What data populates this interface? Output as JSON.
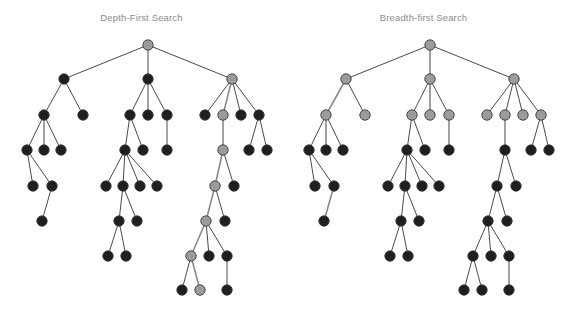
{
  "figure": {
    "type": "diagram",
    "width": 565,
    "height": 310,
    "background": "#ffffff"
  },
  "style": {
    "node_radius": 5.2,
    "node_dark_fill": "#1f1f1f",
    "node_gray_fill": "#9b9b9b",
    "node_stroke": "#3a3a3a",
    "node_stroke_width": 0.9,
    "edge_color": "#4a4a4a",
    "edge_width": 1.0,
    "edge_highlight_color": "#8a8a8a",
    "edge_highlight_width": 1.6,
    "title_color": "#8c8c8c",
    "title_size_px": 9.5
  },
  "panels": [
    {
      "id": "dfs",
      "title": "Depth-First Search",
      "legend_note": "gray nodes mark the depth-first visited path",
      "nodes": [
        {
          "id": "r",
          "x": 148,
          "y": 45,
          "c": "gray"
        },
        {
          "id": "a",
          "x": 64,
          "y": 79,
          "c": "dark"
        },
        {
          "id": "b",
          "x": 148,
          "y": 79,
          "c": "dark"
        },
        {
          "id": "c",
          "x": 232,
          "y": 79,
          "c": "gray"
        },
        {
          "id": "a1",
          "x": 44,
          "y": 115,
          "c": "dark"
        },
        {
          "id": "a2",
          "x": 83,
          "y": 115,
          "c": "dark"
        },
        {
          "id": "a1a",
          "x": 27,
          "y": 150,
          "c": "dark"
        },
        {
          "id": "a1b",
          "x": 44,
          "y": 150,
          "c": "dark"
        },
        {
          "id": "a1c",
          "x": 61,
          "y": 150,
          "c": "dark"
        },
        {
          "id": "a1a1",
          "x": 33,
          "y": 186,
          "c": "dark"
        },
        {
          "id": "a1a2",
          "x": 52,
          "y": 186,
          "c": "dark"
        },
        {
          "id": "a1a2a",
          "x": 42,
          "y": 221,
          "c": "dark"
        },
        {
          "id": "b1",
          "x": 130,
          "y": 115,
          "c": "dark"
        },
        {
          "id": "b2",
          "x": 148,
          "y": 115,
          "c": "dark"
        },
        {
          "id": "b3",
          "x": 167,
          "y": 115,
          "c": "dark"
        },
        {
          "id": "b1a",
          "x": 125,
          "y": 150,
          "c": "dark"
        },
        {
          "id": "b1b",
          "x": 143,
          "y": 150,
          "c": "dark"
        },
        {
          "id": "b3a",
          "x": 167,
          "y": 150,
          "c": "dark"
        },
        {
          "id": "b1a1",
          "x": 106,
          "y": 186,
          "c": "dark"
        },
        {
          "id": "b1a2",
          "x": 123,
          "y": 186,
          "c": "dark"
        },
        {
          "id": "b1a3",
          "x": 140,
          "y": 186,
          "c": "dark"
        },
        {
          "id": "b1a4",
          "x": 157,
          "y": 186,
          "c": "dark"
        },
        {
          "id": "b1a2a",
          "x": 119,
          "y": 221,
          "c": "dark"
        },
        {
          "id": "b1a2b",
          "x": 137,
          "y": 221,
          "c": "dark"
        },
        {
          "id": "b1a2a1",
          "x": 108,
          "y": 256,
          "c": "dark"
        },
        {
          "id": "b1a2a2",
          "x": 126,
          "y": 256,
          "c": "dark"
        },
        {
          "id": "c1",
          "x": 205,
          "y": 115,
          "c": "dark"
        },
        {
          "id": "c2",
          "x": 223,
          "y": 115,
          "c": "gray"
        },
        {
          "id": "c3",
          "x": 241,
          "y": 115,
          "c": "dark"
        },
        {
          "id": "c4",
          "x": 259,
          "y": 115,
          "c": "dark"
        },
        {
          "id": "c2a",
          "x": 223,
          "y": 150,
          "c": "gray"
        },
        {
          "id": "c4a",
          "x": 249,
          "y": 150,
          "c": "dark"
        },
        {
          "id": "c4b",
          "x": 267,
          "y": 150,
          "c": "dark"
        },
        {
          "id": "c2a1",
          "x": 215,
          "y": 186,
          "c": "gray"
        },
        {
          "id": "c2a2",
          "x": 234,
          "y": 186,
          "c": "dark"
        },
        {
          "id": "c2a1a",
          "x": 206,
          "y": 221,
          "c": "gray"
        },
        {
          "id": "c2a1b",
          "x": 225,
          "y": 221,
          "c": "dark"
        },
        {
          "id": "d1",
          "x": 191,
          "y": 256,
          "c": "gray"
        },
        {
          "id": "d2",
          "x": 209,
          "y": 256,
          "c": "dark"
        },
        {
          "id": "d3",
          "x": 227,
          "y": 256,
          "c": "dark"
        },
        {
          "id": "e1",
          "x": 182,
          "y": 290,
          "c": "dark"
        },
        {
          "id": "e2",
          "x": 200,
          "y": 290,
          "c": "gray"
        },
        {
          "id": "e3",
          "x": 227,
          "y": 290,
          "c": "dark"
        }
      ],
      "edges": [
        {
          "f": "r",
          "t": "a",
          "h": false
        },
        {
          "f": "r",
          "t": "b",
          "h": false
        },
        {
          "f": "r",
          "t": "c",
          "h": false
        },
        {
          "f": "a",
          "t": "a1",
          "h": false
        },
        {
          "f": "a",
          "t": "a2",
          "h": false
        },
        {
          "f": "a1",
          "t": "a1a",
          "h": false
        },
        {
          "f": "a1",
          "t": "a1b",
          "h": false
        },
        {
          "f": "a1",
          "t": "a1c",
          "h": false
        },
        {
          "f": "a1a",
          "t": "a1a1",
          "h": false
        },
        {
          "f": "a1a",
          "t": "a1a2",
          "h": false
        },
        {
          "f": "a1a2",
          "t": "a1a2a",
          "h": false
        },
        {
          "f": "b",
          "t": "b1",
          "h": false
        },
        {
          "f": "b",
          "t": "b2",
          "h": false
        },
        {
          "f": "b",
          "t": "b3",
          "h": false
        },
        {
          "f": "b1",
          "t": "b1a",
          "h": false
        },
        {
          "f": "b1",
          "t": "b1b",
          "h": false
        },
        {
          "f": "b3",
          "t": "b3a",
          "h": false
        },
        {
          "f": "b1a",
          "t": "b1a1",
          "h": false
        },
        {
          "f": "b1a",
          "t": "b1a2",
          "h": false
        },
        {
          "f": "b1a",
          "t": "b1a3",
          "h": false
        },
        {
          "f": "b1a",
          "t": "b1a4",
          "h": false
        },
        {
          "f": "b1a2",
          "t": "b1a2a",
          "h": false
        },
        {
          "f": "b1a2",
          "t": "b1a2b",
          "h": false
        },
        {
          "f": "b1a2a",
          "t": "b1a2a1",
          "h": false
        },
        {
          "f": "b1a2a",
          "t": "b1a2a2",
          "h": false
        },
        {
          "f": "c",
          "t": "c1",
          "h": false
        },
        {
          "f": "c",
          "t": "c2",
          "h": true
        },
        {
          "f": "c",
          "t": "c3",
          "h": false
        },
        {
          "f": "c",
          "t": "c4",
          "h": false
        },
        {
          "f": "c2",
          "t": "c2a",
          "h": true
        },
        {
          "f": "c4",
          "t": "c4a",
          "h": false
        },
        {
          "f": "c4",
          "t": "c4b",
          "h": false
        },
        {
          "f": "c2a",
          "t": "c2a1",
          "h": true
        },
        {
          "f": "c2a",
          "t": "c2a2",
          "h": false
        },
        {
          "f": "c2a1",
          "t": "c2a1a",
          "h": true
        },
        {
          "f": "c2a1",
          "t": "c2a1b",
          "h": false
        },
        {
          "f": "c2a1a",
          "t": "d1",
          "h": true
        },
        {
          "f": "c2a1a",
          "t": "d2",
          "h": false
        },
        {
          "f": "c2a1a",
          "t": "d3",
          "h": false
        },
        {
          "f": "d1",
          "t": "e1",
          "h": false
        },
        {
          "f": "d1",
          "t": "e2",
          "h": true
        },
        {
          "f": "d3",
          "t": "e3",
          "h": false
        }
      ]
    },
    {
      "id": "bfs",
      "title": "Breadth-first Search",
      "legend_note": "gray nodes mark the breadth-first visited frontier",
      "nodes": [
        {
          "id": "r",
          "x": 148,
          "y": 45,
          "c": "gray"
        },
        {
          "id": "a",
          "x": 64,
          "y": 79,
          "c": "gray"
        },
        {
          "id": "b",
          "x": 148,
          "y": 79,
          "c": "gray"
        },
        {
          "id": "c",
          "x": 232,
          "y": 79,
          "c": "gray"
        },
        {
          "id": "a1",
          "x": 44,
          "y": 115,
          "c": "gray"
        },
        {
          "id": "a2",
          "x": 83,
          "y": 115,
          "c": "gray"
        },
        {
          "id": "a1a",
          "x": 27,
          "y": 150,
          "c": "dark"
        },
        {
          "id": "a1b",
          "x": 44,
          "y": 150,
          "c": "dark"
        },
        {
          "id": "a1c",
          "x": 61,
          "y": 150,
          "c": "dark"
        },
        {
          "id": "a1a1",
          "x": 33,
          "y": 186,
          "c": "dark"
        },
        {
          "id": "a1a2",
          "x": 52,
          "y": 186,
          "c": "dark"
        },
        {
          "id": "a1a2a",
          "x": 42,
          "y": 221,
          "c": "dark"
        },
        {
          "id": "b1",
          "x": 130,
          "y": 115,
          "c": "gray"
        },
        {
          "id": "b2",
          "x": 148,
          "y": 115,
          "c": "gray"
        },
        {
          "id": "b3",
          "x": 167,
          "y": 115,
          "c": "gray"
        },
        {
          "id": "b1a",
          "x": 125,
          "y": 150,
          "c": "dark"
        },
        {
          "id": "b1b",
          "x": 143,
          "y": 150,
          "c": "dark"
        },
        {
          "id": "b3a",
          "x": 167,
          "y": 150,
          "c": "dark"
        },
        {
          "id": "b1a1",
          "x": 106,
          "y": 186,
          "c": "dark"
        },
        {
          "id": "b1a2",
          "x": 123,
          "y": 186,
          "c": "dark"
        },
        {
          "id": "b1a3",
          "x": 140,
          "y": 186,
          "c": "dark"
        },
        {
          "id": "b1a4",
          "x": 157,
          "y": 186,
          "c": "dark"
        },
        {
          "id": "b1a2a",
          "x": 119,
          "y": 221,
          "c": "dark"
        },
        {
          "id": "b1a2b",
          "x": 137,
          "y": 221,
          "c": "dark"
        },
        {
          "id": "b1a2a1",
          "x": 108,
          "y": 256,
          "c": "dark"
        },
        {
          "id": "b1a2a2",
          "x": 126,
          "y": 256,
          "c": "dark"
        },
        {
          "id": "c1",
          "x": 205,
          "y": 115,
          "c": "gray"
        },
        {
          "id": "c2",
          "x": 223,
          "y": 115,
          "c": "gray"
        },
        {
          "id": "c3",
          "x": 241,
          "y": 115,
          "c": "gray"
        },
        {
          "id": "c4",
          "x": 259,
          "y": 115,
          "c": "gray"
        },
        {
          "id": "c2a",
          "x": 223,
          "y": 150,
          "c": "dark"
        },
        {
          "id": "c4a",
          "x": 249,
          "y": 150,
          "c": "dark"
        },
        {
          "id": "c4b",
          "x": 267,
          "y": 150,
          "c": "dark"
        },
        {
          "id": "c2a1",
          "x": 215,
          "y": 186,
          "c": "dark"
        },
        {
          "id": "c2a2",
          "x": 234,
          "y": 186,
          "c": "dark"
        },
        {
          "id": "c2a1a",
          "x": 206,
          "y": 221,
          "c": "dark"
        },
        {
          "id": "c2a1b",
          "x": 225,
          "y": 221,
          "c": "dark"
        },
        {
          "id": "d1",
          "x": 191,
          "y": 256,
          "c": "dark"
        },
        {
          "id": "d2",
          "x": 209,
          "y": 256,
          "c": "dark"
        },
        {
          "id": "d3",
          "x": 227,
          "y": 256,
          "c": "dark"
        },
        {
          "id": "e1",
          "x": 182,
          "y": 290,
          "c": "dark"
        },
        {
          "id": "e2",
          "x": 200,
          "y": 290,
          "c": "dark"
        },
        {
          "id": "e3",
          "x": 227,
          "y": 290,
          "c": "dark"
        }
      ],
      "edges": [
        {
          "f": "r",
          "t": "a",
          "h": false
        },
        {
          "f": "r",
          "t": "b",
          "h": true
        },
        {
          "f": "r",
          "t": "c",
          "h": false
        },
        {
          "f": "a",
          "t": "a1",
          "h": true
        },
        {
          "f": "a",
          "t": "a2",
          "h": false
        },
        {
          "f": "a1",
          "t": "a1a",
          "h": false
        },
        {
          "f": "a1",
          "t": "a1b",
          "h": true
        },
        {
          "f": "a1",
          "t": "a1c",
          "h": false
        },
        {
          "f": "a1a",
          "t": "a1a1",
          "h": false
        },
        {
          "f": "a1a",
          "t": "a1a2",
          "h": false
        },
        {
          "f": "a1a2",
          "t": "a1a2a",
          "h": true
        },
        {
          "f": "b",
          "t": "b1",
          "h": false
        },
        {
          "f": "b",
          "t": "b2",
          "h": true
        },
        {
          "f": "b",
          "t": "b3",
          "h": false
        },
        {
          "f": "b1",
          "t": "b1a",
          "h": false
        },
        {
          "f": "b1",
          "t": "b1b",
          "h": false
        },
        {
          "f": "b3",
          "t": "b3a",
          "h": true
        },
        {
          "f": "b1a",
          "t": "b1a1",
          "h": false
        },
        {
          "f": "b1a",
          "t": "b1a2",
          "h": false
        },
        {
          "f": "b1a",
          "t": "b1a3",
          "h": false
        },
        {
          "f": "b1a",
          "t": "b1a4",
          "h": false
        },
        {
          "f": "b1a2",
          "t": "b1a2a",
          "h": false
        },
        {
          "f": "b1a2",
          "t": "b1a2b",
          "h": false
        },
        {
          "f": "b1a2a",
          "t": "b1a2a1",
          "h": false
        },
        {
          "f": "b1a2a",
          "t": "b1a2a2",
          "h": false
        },
        {
          "f": "c",
          "t": "c1",
          "h": false
        },
        {
          "f": "c",
          "t": "c2",
          "h": false
        },
        {
          "f": "c",
          "t": "c3",
          "h": false
        },
        {
          "f": "c",
          "t": "c4",
          "h": false
        },
        {
          "f": "c2",
          "t": "c2a",
          "h": true
        },
        {
          "f": "c4",
          "t": "c4a",
          "h": false
        },
        {
          "f": "c4",
          "t": "c4b",
          "h": false
        },
        {
          "f": "c2a",
          "t": "c2a1",
          "h": false
        },
        {
          "f": "c2a",
          "t": "c2a2",
          "h": false
        },
        {
          "f": "c2a1",
          "t": "c2a1a",
          "h": false
        },
        {
          "f": "c2a1",
          "t": "c2a1b",
          "h": false
        },
        {
          "f": "c2a1a",
          "t": "d1",
          "h": false
        },
        {
          "f": "c2a1a",
          "t": "d2",
          "h": false
        },
        {
          "f": "c2a1a",
          "t": "d3",
          "h": false
        },
        {
          "f": "d1",
          "t": "e1",
          "h": false
        },
        {
          "f": "d1",
          "t": "e2",
          "h": false
        },
        {
          "f": "d3",
          "t": "e3",
          "h": true
        }
      ]
    }
  ]
}
